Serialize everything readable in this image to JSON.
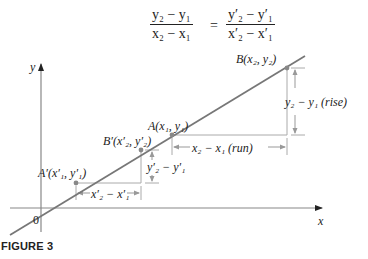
{
  "equation": {
    "left_numerator": "y₂ − y₁",
    "left_denominator": "x₂ − x₁",
    "equals": "=",
    "right_numerator": "y′₂ − y′₁",
    "right_denominator": "x′₂ − x′₁"
  },
  "axes": {
    "y_label": "y",
    "x_label": "x",
    "origin_label": "0"
  },
  "points": {
    "A_prime": "A′(x′₁, y′₁)",
    "B_prime": "B′(x′₂, y′₂)",
    "A": "A(x₁, y₁)",
    "B": "B(x₂, y₂)"
  },
  "dimensions": {
    "small_run": "x′₂ − x′₁",
    "small_rise": "y′₂ − y′₁",
    "large_run": "x₂ − x₁ (run)",
    "large_rise": "y₂ − y₁ (rise)"
  },
  "caption": "FIGURE 3",
  "colors": {
    "line": "#777777",
    "axis": "#888888",
    "triangle": "#aaaaaa",
    "text": "#222222"
  }
}
